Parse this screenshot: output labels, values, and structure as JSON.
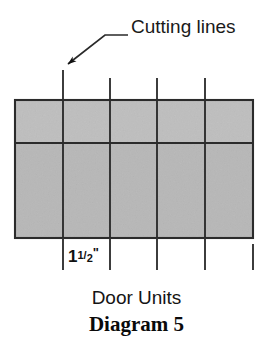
{
  "figure": {
    "width": 273,
    "height": 347,
    "background_color": "#ffffff",
    "callout": {
      "label": "Cutting lines",
      "leader_icon": "arrow-icon",
      "arrow_tip": [
        62,
        70
      ],
      "arrow_elbow": [
        105,
        35
      ],
      "arrow_end": [
        128,
        35
      ]
    },
    "panel": {
      "name": "door-units-panel",
      "x": 15,
      "y": 100,
      "width": 238,
      "height": 138,
      "fill_color": "#b9b9b9",
      "fill_color_top_band": "#c2c2c2",
      "stroke_color": "#2b2b2b",
      "horizontal_divider_y": 143
    },
    "cutting_lines": {
      "name": "cutting-line",
      "stroke_color": "#333333",
      "x_positions": [
        63,
        110,
        157,
        205
      ],
      "top_y": [
        70,
        78,
        78,
        78
      ],
      "bottom_y": 270,
      "edge_tick": {
        "x": 253,
        "top_y": 244,
        "bottom_y": 270
      }
    },
    "dimension": {
      "name": "width-dimension-label",
      "whole": "1",
      "numerator": "1",
      "denominator": "2",
      "unit": "\"",
      "text": "1 1/2\""
    },
    "caption": {
      "title": "Door Units",
      "subtitle": "Diagram 5"
    }
  }
}
